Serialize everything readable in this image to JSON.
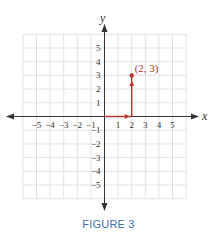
{
  "chart_data": {
    "type": "scatter",
    "title": "",
    "xlabel": "x",
    "ylabel": "y",
    "xlim": [
      -6,
      6
    ],
    "ylim": [
      -6,
      6
    ],
    "grid": true,
    "x_ticks": [
      -5,
      -4,
      -3,
      -2,
      -1,
      1,
      2,
      3,
      4,
      5
    ],
    "y_ticks": [
      -5,
      -4,
      -3,
      -2,
      -1,
      1,
      2,
      3,
      4,
      5
    ],
    "x_tick_labels": [
      "−5",
      "−4",
      "−3",
      "−2",
      "−1",
      "1",
      "2",
      "3",
      "4",
      "5"
    ],
    "y_tick_labels": [
      "−5",
      "−4",
      "−3",
      "−2",
      "−1",
      "1",
      "2",
      "3",
      "4",
      "5"
    ],
    "points": [
      {
        "x": 2,
        "y": 3,
        "label": "(2, 3)"
      }
    ],
    "annotations": [
      {
        "type": "arrow",
        "from": [
          0,
          0
        ],
        "to": [
          2,
          0
        ],
        "description": "move 2 units right along x-axis"
      },
      {
        "type": "arrow",
        "from": [
          2,
          0
        ],
        "to": [
          2,
          3
        ],
        "description": "move 3 units up to the point"
      }
    ]
  },
  "caption": "FIGURE 3",
  "colors": {
    "axis": "#333333",
    "grid": "#d9d9d9",
    "path": "#b5352b",
    "caption": "#3a6fb0"
  }
}
